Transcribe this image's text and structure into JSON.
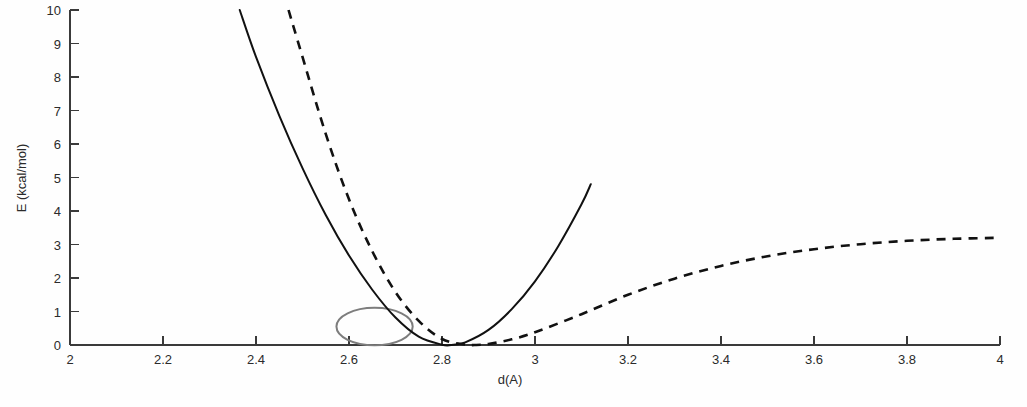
{
  "figure": {
    "background_color": "#fefefe",
    "axis_color": "#3a3a3a",
    "curve_color": "#111111",
    "highlight_color": "#7d7d7d"
  },
  "axes": {
    "x_title": "d(A)",
    "y_title": "E (kcal/mol)",
    "x_ticks": [
      "2",
      "2.2",
      "2.4",
      "2.6",
      "2.8",
      "3",
      "3.2",
      "3.4",
      "3.6",
      "3.8",
      "4"
    ],
    "y_ticks": [
      "0",
      "1",
      "2",
      "3",
      "4",
      "5",
      "6",
      "7",
      "8",
      "9",
      "10"
    ]
  },
  "chart_data": {
    "type": "line",
    "title": "",
    "subtitle": "",
    "xlabel": "d(A)",
    "ylabel": "E (kcal/mol)",
    "xlim": [
      2,
      4
    ],
    "ylim": [
      0,
      10
    ],
    "x_tick_values": [
      2,
      2.2,
      2.4,
      2.6,
      2.8,
      3.0,
      3.2,
      3.4,
      3.6,
      3.8,
      4.0
    ],
    "y_tick_values": [
      0,
      1,
      2,
      3,
      4,
      5,
      6,
      7,
      8,
      9,
      10
    ],
    "grid": false,
    "legend": null,
    "legend_position": "none",
    "series": [
      {
        "name": "harmonic potential",
        "style": "solid",
        "color": "#111111",
        "x": [
          2.365,
          2.4,
          2.45,
          2.5,
          2.55,
          2.6,
          2.65,
          2.7,
          2.75,
          2.8,
          2.82,
          2.85,
          2.9,
          2.95,
          3.0,
          3.05,
          3.1,
          3.12
        ],
        "y": [
          10.0,
          8.6,
          6.85,
          5.28,
          3.88,
          2.67,
          1.65,
          0.82,
          0.25,
          0.01,
          0.0,
          0.08,
          0.45,
          1.07,
          1.9,
          2.95,
          4.2,
          4.8
        ]
      },
      {
        "name": "Morse potential",
        "style": "dashed",
        "color": "#111111",
        "x": [
          2.47,
          2.5,
          2.55,
          2.6,
          2.65,
          2.7,
          2.75,
          2.8,
          2.85,
          2.87,
          2.9,
          2.95,
          3.0,
          3.1,
          3.2,
          3.3,
          3.4,
          3.5,
          3.6,
          3.7,
          3.8,
          3.9,
          4.0
        ],
        "y": [
          10.0,
          8.6,
          6.3,
          4.35,
          2.8,
          1.58,
          0.72,
          0.18,
          0.01,
          0.0,
          0.03,
          0.17,
          0.38,
          0.92,
          1.5,
          1.98,
          2.36,
          2.65,
          2.86,
          3.01,
          3.11,
          3.17,
          3.2
        ]
      }
    ],
    "annotations": [
      {
        "type": "ellipse",
        "name": "crossing-region-highlight",
        "color": "#7d7d7d",
        "center_x": 2.655,
        "center_y": 0.55,
        "radius_x": 0.082,
        "radius_y": 0.56
      }
    ]
  }
}
